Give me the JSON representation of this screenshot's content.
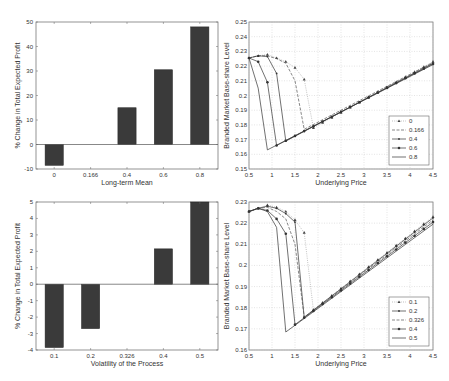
{
  "chart_data": [
    {
      "id": "top-left",
      "type": "bar",
      "categories": [
        "0",
        "0.166",
        "0.4",
        "0.6",
        "0.8"
      ],
      "values": [
        -8.5,
        0,
        15,
        30.5,
        48
      ],
      "xlabel": "Long-term Mean",
      "ylabel": "% Change in Total Expected Profit",
      "ylim": [
        -10,
        50
      ],
      "yticks": [
        "-10",
        "0",
        "10",
        "20",
        "30",
        "40",
        "50"
      ],
      "grid": false,
      "bar_color": "#3a3a3a",
      "box": {
        "left": 36,
        "right": 218,
        "top": 22,
        "bottom": 169
      }
    },
    {
      "id": "bottom-left",
      "type": "bar",
      "categories": [
        "0.1",
        "0.2",
        "0.326",
        "0.4",
        "0.5"
      ],
      "values": [
        -3.85,
        -2.7,
        0,
        2.15,
        5
      ],
      "xlabel": "Volatility of the Process",
      "ylabel": "% Change in Total Expected Profit",
      "ylim": [
        -4,
        5
      ],
      "yticks": [
        "-4",
        "-3",
        "-2",
        "-1",
        "0",
        "1",
        "2",
        "3",
        "4",
        "5"
      ],
      "grid": false,
      "bar_color": "#3a3a3a",
      "box": {
        "left": 36,
        "right": 218,
        "top": 202,
        "bottom": 350
      }
    },
    {
      "id": "top-right",
      "type": "line",
      "xlabel": "Underlying Price",
      "ylabel": "Branded Market Base-share Level",
      "xlim": [
        0.5,
        4.5
      ],
      "ylim": [
        0.15,
        0.25
      ],
      "xticks": [
        "0.5",
        "1",
        "1.5",
        "2",
        "2.5",
        "3",
        "3.5",
        "4",
        "4.5"
      ],
      "yticks": [
        "0.15",
        "0.16",
        "0.17",
        "0.18",
        "0.19",
        "0.2",
        "0.21",
        "0.22",
        "0.23",
        "0.24",
        "0.25"
      ],
      "grid": true,
      "legend_position": "lower right",
      "box": {
        "left": 249,
        "right": 433,
        "top": 22,
        "bottom": 169
      },
      "series": [
        {
          "name": "0",
          "style": "dotted-triangle",
          "x": [
            0.5,
            0.7,
            0.9,
            1.1,
            1.3,
            1.5,
            1.7,
            1.9,
            4.5
          ],
          "y": [
            0.2255,
            0.227,
            0.2278,
            0.2255,
            0.223,
            0.219,
            0.211,
            0.178,
            0.223
          ]
        },
        {
          "name": "0.166",
          "style": "dashed",
          "x": [
            0.5,
            0.7,
            0.9,
            1.1,
            1.3,
            1.5,
            1.7,
            4.5
          ],
          "y": [
            0.2255,
            0.227,
            0.227,
            0.225,
            0.222,
            0.21,
            0.177,
            0.2225
          ]
        },
        {
          "name": "0.4",
          "style": "solid-dot",
          "x": [
            0.5,
            0.7,
            0.9,
            1.1,
            1.3,
            4.5
          ],
          "y": [
            0.2255,
            0.227,
            0.2265,
            0.215,
            0.169,
            0.222
          ]
        },
        {
          "name": "0.6",
          "style": "solid-star",
          "x": [
            0.5,
            0.7,
            0.9,
            1.1,
            4.5
          ],
          "y": [
            0.2255,
            0.223,
            0.209,
            0.166,
            0.2215
          ]
        },
        {
          "name": "0.8",
          "style": "solid",
          "x": [
            0.5,
            0.7,
            0.9,
            4.5
          ],
          "y": [
            0.2255,
            0.205,
            0.163,
            0.221
          ]
        }
      ]
    },
    {
      "id": "bottom-right",
      "type": "line",
      "xlabel": "Underlying Price",
      "ylabel": "Branded Market Base-share Level",
      "xlim": [
        0.5,
        4.5
      ],
      "ylim": [
        0.16,
        0.23
      ],
      "xticks": [
        "0.5",
        "1",
        "1.5",
        "2",
        "2.5",
        "3",
        "3.5",
        "4",
        "4.5"
      ],
      "yticks": [
        "0.16",
        "0.17",
        "0.18",
        "0.19",
        "0.2",
        "0.21",
        "0.22",
        "0.23"
      ],
      "grid": true,
      "legend_position": "lower right",
      "box": {
        "left": 249,
        "right": 433,
        "top": 202,
        "bottom": 350
      },
      "series": [
        {
          "name": "0.1",
          "style": "dotted-triangle",
          "x": [
            0.5,
            0.7,
            0.9,
            1.1,
            1.3,
            1.5,
            1.7,
            1.9,
            4.5
          ],
          "y": [
            0.2255,
            0.227,
            0.2285,
            0.2275,
            0.2255,
            0.2215,
            0.2155,
            0.179,
            0.223
          ]
        },
        {
          "name": "0.2",
          "style": "solid-dot",
          "x": [
            0.5,
            0.7,
            0.9,
            1.1,
            1.3,
            1.5,
            1.7,
            4.5
          ],
          "y": [
            0.2255,
            0.227,
            0.228,
            0.227,
            0.2245,
            0.2205,
            0.1755,
            0.2225
          ]
        },
        {
          "name": "0.326",
          "style": "dashed",
          "x": [
            0.5,
            0.7,
            0.9,
            1.1,
            1.3,
            1.5,
            1.7,
            4.5
          ],
          "y": [
            0.2255,
            0.227,
            0.2275,
            0.2255,
            0.222,
            0.21,
            0.1755,
            0.2215
          ]
        },
        {
          "name": "0.4",
          "style": "solid-star",
          "x": [
            0.5,
            0.7,
            0.9,
            1.1,
            1.3,
            1.5,
            4.5
          ],
          "y": [
            0.2255,
            0.227,
            0.226,
            0.222,
            0.215,
            0.172,
            0.2205
          ]
        },
        {
          "name": "0.5",
          "style": "solid",
          "x": [
            0.5,
            0.7,
            0.9,
            1.1,
            1.3,
            4.5
          ],
          "y": [
            0.2255,
            0.227,
            0.2255,
            0.218,
            0.1685,
            0.2195
          ]
        }
      ]
    }
  ]
}
